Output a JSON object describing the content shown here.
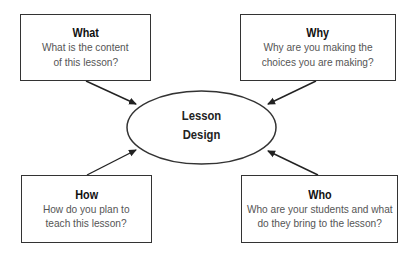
{
  "diagram": {
    "center": {
      "line1": "Lesson",
      "line2": "Design"
    },
    "boxes": {
      "what": {
        "title": "What",
        "line1": "What is the content",
        "line2": "of this lesson?"
      },
      "why": {
        "title": "Why",
        "line1": "Why are you making the",
        "line2": "choices you are making?"
      },
      "how": {
        "title": "How",
        "line1": "How do you plan to",
        "line2": "teach this lesson?"
      },
      "who": {
        "title": "Who",
        "line1": "Who are your students and what",
        "line2": "do they bring to the lesson?"
      }
    },
    "colors": {
      "stroke": "#333333",
      "title": "#111111",
      "body_text": "#555555",
      "background": "#ffffff"
    }
  }
}
